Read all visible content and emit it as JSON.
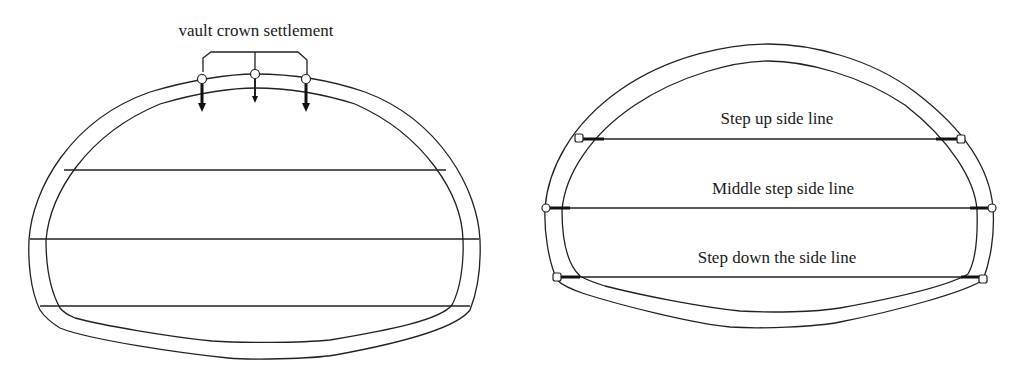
{
  "figure": {
    "left_panel": {
      "title": "vault crown settlement",
      "description": "Tunnel cross-section with three vault crown settlement measuring points connected by a bracket",
      "measuring_points": 3,
      "horizontal_bench_lines": 3
    },
    "right_panel": {
      "labels": {
        "upper": "Step up side line",
        "middle": "Middle step side line",
        "lower": "Step down the side line"
      },
      "description": "Tunnel cross-section with three horizontal convergence measuring lines, each ending in measuring points on both sides",
      "measuring_lines": 3
    },
    "colors": {
      "line": "#222222",
      "background": "#ffffff"
    }
  }
}
